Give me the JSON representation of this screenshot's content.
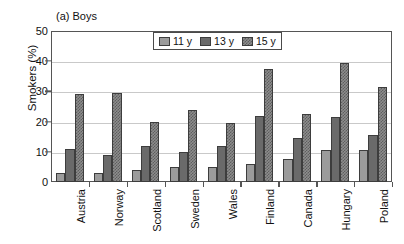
{
  "chart_data": {
    "type": "bar",
    "title": "(a) Boys",
    "xlabel": "",
    "ylabel": "Smokers (%)",
    "ylim": [
      0,
      50
    ],
    "yticks": [
      0,
      10,
      20,
      30,
      40,
      50
    ],
    "grid": true,
    "legend_position": "top-center",
    "categories": [
      "Austria",
      "Norway",
      "Scotland",
      "Sweden",
      "Wales",
      "Finland",
      "Canada",
      "Hungary",
      "Poland"
    ],
    "series": [
      {
        "name": "11 y",
        "values": [
          3,
          3,
          4,
          5,
          5,
          6,
          7.5,
          10.5,
          10.5
        ]
      },
      {
        "name": "13 y",
        "values": [
          11,
          9,
          12,
          10,
          12,
          22,
          14.5,
          21.5,
          15.5
        ]
      },
      {
        "name": "15 y",
        "values": [
          29,
          29.5,
          20,
          24,
          19.5,
          37.5,
          22.5,
          39.5,
          31.5
        ]
      }
    ]
  },
  "legend": {
    "items": [
      {
        "label": "11 y"
      },
      {
        "label": "13 y"
      },
      {
        "label": "15 y"
      }
    ]
  }
}
